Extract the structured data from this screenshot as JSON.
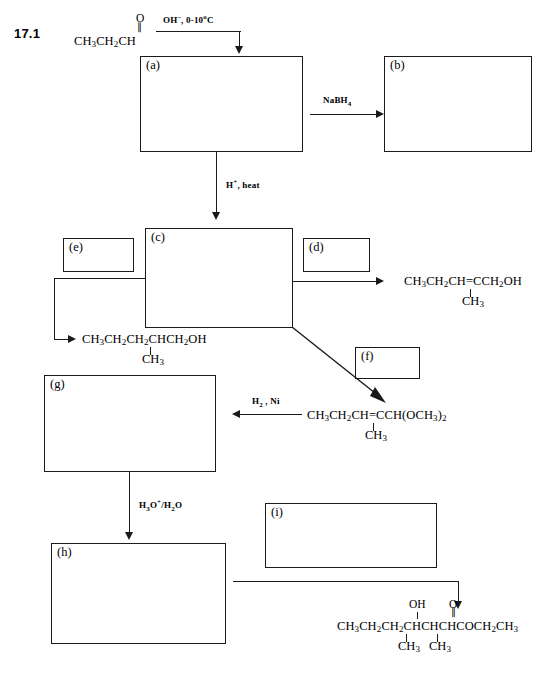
{
  "problem": {
    "number": "17.1"
  },
  "starting_material": {
    "name": "propanal",
    "formula_main": "CH3CH2CH",
    "carbonyl_oxygen": "O",
    "carbonyl_bond": "double"
  },
  "reagents": {
    "step1": "OH⁻, 0-10°C",
    "step1_parts": {
      "base": "OH",
      "charge": "−",
      "conditions": ", 0-10",
      "deg": "°",
      "unit": "C"
    },
    "step2": "NaBH4",
    "step3": "H⁺, heat",
    "step4": "H2 , Ni",
    "step5": "H3O⁺/H2O"
  },
  "boxes": [
    {
      "id": "a",
      "label": "(a)",
      "x": 140,
      "y": 56,
      "w": 163,
      "h": 96
    },
    {
      "id": "b",
      "label": "(b)",
      "x": 384,
      "y": 56,
      "w": 148,
      "h": 96
    },
    {
      "id": "c",
      "label": "(c)",
      "x": 145,
      "y": 228,
      "w": 148,
      "h": 100
    },
    {
      "id": "d",
      "label": "(d)",
      "x": 303,
      "y": 238,
      "w": 67,
      "h": 34
    },
    {
      "id": "e",
      "label": "(e)",
      "x": 63,
      "y": 238,
      "w": 71,
      "h": 34
    },
    {
      "id": "f",
      "label": "(f)",
      "x": 355,
      "y": 347,
      "w": 65,
      "h": 32
    },
    {
      "id": "g",
      "label": "(g)",
      "x": 44,
      "y": 375,
      "w": 172,
      "h": 97
    },
    {
      "id": "h",
      "label": "(h)",
      "x": 51,
      "y": 543,
      "w": 175,
      "h": 101
    },
    {
      "id": "i",
      "label": "(i)",
      "x": 265,
      "y": 503,
      "w": 172,
      "h": 65
    }
  ],
  "products": {
    "d_product": {
      "chain": "CH3CH2CH=CCH2OH",
      "branch": "CH3",
      "segments": [
        {
          "t": "CH",
          "sub": "3"
        },
        {
          "t": "CH",
          "sub": "2"
        },
        {
          "t": "CH=CCH",
          "sub": "2"
        },
        {
          "t": "OH",
          "sub": ""
        }
      ]
    },
    "e_product": {
      "chain": "CH3CH2CH2CHCH2OH",
      "branch": "CH3"
    },
    "acetal": {
      "chain": "CH3CH2CH=CCH(OCH3)2",
      "branch": "CH3"
    },
    "final_product": {
      "chain": "CH3CH2CH2CHCHCHCOCH2CH3",
      "hydroxyl": "OH",
      "carbonyl": "O",
      "branch_left": "CH3",
      "branch_right": "CH3"
    }
  }
}
